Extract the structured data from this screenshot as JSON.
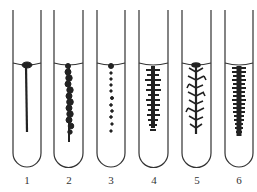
{
  "figure": {
    "tubes": [
      {
        "label": "1",
        "pattern": "filiform"
      },
      {
        "label": "2",
        "pattern": "beaded-dense"
      },
      {
        "label": "3",
        "pattern": "beaded-dotted"
      },
      {
        "label": "4",
        "pattern": "villous"
      },
      {
        "label": "5",
        "pattern": "arborescent"
      },
      {
        "label": "6",
        "pattern": "dense-papillate"
      }
    ]
  },
  "colors": {
    "ink": "#222222",
    "background": "#ffffff"
  }
}
